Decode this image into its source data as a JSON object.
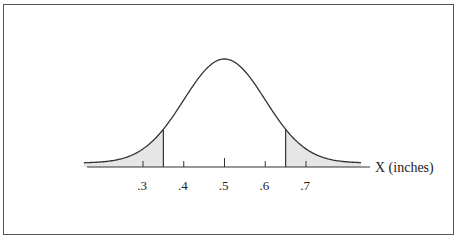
{
  "chart_data": {
    "type": "area",
    "title": "",
    "xlabel": "X (inches)",
    "ylabel": "",
    "x_ticks": [
      ".3",
      ".4",
      ".5",
      ".6",
      ".7"
    ],
    "x_tick_values": [
      0.3,
      0.4,
      0.5,
      0.6,
      0.7
    ],
    "xlim": [
      0.155,
      0.835
    ],
    "distribution": {
      "kind": "normal",
      "mean": 0.5,
      "sd": 0.1
    },
    "shaded_regions": [
      {
        "name": "left-tail",
        "from": 0.155,
        "to": 0.35
      },
      {
        "name": "right-tail",
        "from": 0.65,
        "to": 0.835
      }
    ],
    "cut_lines": [
      0.35,
      0.65
    ],
    "grid": false,
    "legend": null
  },
  "colors": {
    "curve": "#333333",
    "shade": "#e6e6e6",
    "frame": "#555555",
    "text": "#222222"
  }
}
